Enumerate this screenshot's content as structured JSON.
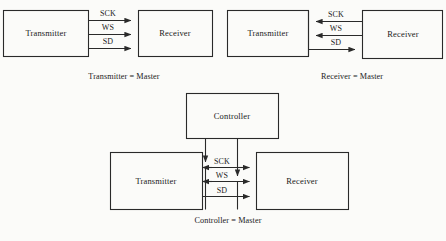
{
  "figure": {
    "background_color": "#fbfbf9",
    "line_color": "#2a2a2a",
    "text_color": "#1a1a1a"
  },
  "diagrams": [
    {
      "id": "transmitter-master",
      "caption": "Transmitter = Master",
      "left_box": "Transmitter",
      "right_box": "Receiver",
      "signals": [
        {
          "name": "SCK",
          "direction": "right"
        },
        {
          "name": "WS",
          "direction": "right"
        },
        {
          "name": "SD",
          "direction": "right"
        }
      ]
    },
    {
      "id": "receiver-master",
      "caption": "Receiver = Master",
      "left_box": "Transmitter",
      "right_box": "Receiver",
      "signals": [
        {
          "name": "SCK",
          "direction": "left"
        },
        {
          "name": "WS",
          "direction": "left"
        },
        {
          "name": "SD",
          "direction": "right"
        }
      ]
    },
    {
      "id": "controller-master",
      "caption": "Controller = Master",
      "top_box": "Controller",
      "left_box": "Transmitter",
      "right_box": "Receiver",
      "signals": [
        {
          "name": "SCK",
          "direction": "both"
        },
        {
          "name": "WS",
          "direction": "both"
        },
        {
          "name": "SD",
          "direction": "right"
        }
      ]
    }
  ],
  "labels": {
    "d1_left": "Transmitter",
    "d1_right": "Receiver",
    "d1_sck": "SCK",
    "d1_ws": "WS",
    "d1_sd": "SD",
    "d1_caption": "Transmitter = Master",
    "d2_left": "Transmitter",
    "d2_right": "Receiver",
    "d2_sck": "SCK",
    "d2_ws": "WS",
    "d2_sd": "SD",
    "d2_caption": "Receiver = Master",
    "d3_top": "Controller",
    "d3_left": "Transmitter",
    "d3_right": "Receiver",
    "d3_sck": "SCK",
    "d3_ws": "WS",
    "d3_sd": "SD",
    "d3_caption": "Controller = Master"
  }
}
